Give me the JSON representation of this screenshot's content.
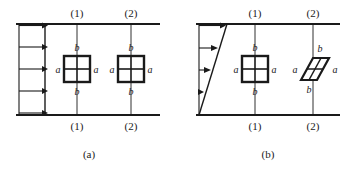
{
  "figure": {
    "title_alt": "Uniform flow versus shear flow deformation of a fluid element",
    "colors": {
      "line": "#1a1a1a",
      "background": "#ffffff"
    },
    "panels": [
      {
        "id": "a",
        "caption": "(a)",
        "flow_type": "uniform",
        "velocity_profile": {
          "shape": "uniform",
          "arrow_count": 5,
          "arrow_label": "",
          "description": "Five equal-length horizontal arrows of identical magnitude"
        },
        "sections": [
          {
            "label_top": "(1)",
            "label_bottom": "(1)",
            "element_shape": "square",
            "element_labels": {
              "top": "b",
              "bottom": "b",
              "left": "a",
              "right": "a"
            }
          },
          {
            "label_top": "(2)",
            "label_bottom": "(2)",
            "element_shape": "square",
            "element_labels": {
              "top": "b",
              "bottom": "b",
              "left": "a",
              "right": "a"
            }
          }
        ]
      },
      {
        "id": "b",
        "caption": "(b)",
        "flow_type": "shear",
        "velocity_profile": {
          "shape": "linear-triangular",
          "arrow_count": 4,
          "arrow_label": "",
          "description": "Four arrows increasing in length from bottom to top forming a triangular linear shear profile"
        },
        "sections": [
          {
            "label_top": "(1)",
            "label_bottom": "(1)",
            "element_shape": "square",
            "element_labels": {
              "top": "b",
              "bottom": "b",
              "left": "a",
              "right": "a"
            }
          },
          {
            "label_top": "(2)",
            "label_bottom": "(2)",
            "element_shape": "parallelogram",
            "element_labels": {
              "top": "b",
              "bottom": "b",
              "left": "a",
              "right": "a"
            }
          }
        ]
      }
    ]
  }
}
